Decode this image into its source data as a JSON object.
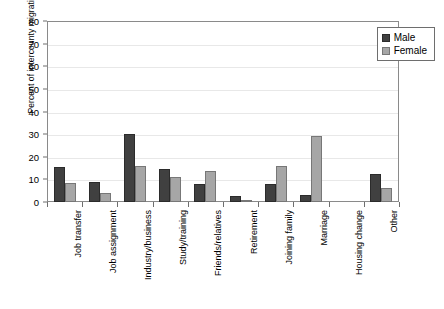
{
  "chart_data": {
    "type": "bar",
    "title": "",
    "xlabel": "",
    "ylabel": "Percent of intercounty migration",
    "ylim": [
      0,
      80
    ],
    "ytick_labels": [
      "80",
      "70",
      "60",
      "50",
      "40",
      "30",
      "20",
      "10",
      "0"
    ],
    "ytick_values": [
      80,
      70,
      60,
      50,
      40,
      30,
      20,
      10,
      0
    ],
    "grid": true,
    "legend_position": "top-right",
    "categories": [
      "Job transfer",
      "Job assignment",
      "Industry/business",
      "Study/training",
      "Friends/relatives",
      "Retirement",
      "Joining family",
      "Marriage",
      "Housing change",
      "Other"
    ],
    "series": [
      {
        "name": "Male",
        "color": "#404040",
        "values": [
          15.5,
          9,
          30,
          14.5,
          8,
          2.5,
          8,
          3,
          0,
          12.5
        ]
      },
      {
        "name": "Female",
        "color": "#a6a6a6",
        "values": [
          8.5,
          4,
          16,
          11,
          13.5,
          1,
          16,
          29,
          0,
          6
        ]
      }
    ]
  },
  "legend": {
    "items": [
      {
        "label": "Male",
        "swatch": "male-swatch-icon"
      },
      {
        "label": "Female",
        "swatch": "female-swatch-icon"
      }
    ]
  }
}
